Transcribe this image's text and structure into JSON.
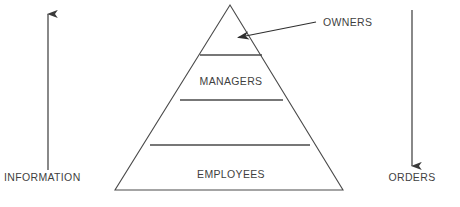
{
  "diagram": {
    "type": "pyramid-hierarchy",
    "background_color": "#ffffff",
    "line_color": "#4a4a4a",
    "text_color": "#3f3f3f",
    "pyramid": {
      "apex": {
        "x": 230,
        "y": 5
      },
      "base_left": {
        "x": 115,
        "y": 190
      },
      "base_right": {
        "x": 343,
        "y": 190
      },
      "levels": [
        {
          "name": "owners",
          "label": "",
          "divider_y": 55,
          "divider_x1": 200,
          "divider_x2": 262
        },
        {
          "name": "managers",
          "label": "MANAGERS",
          "divider_y": 100,
          "divider_x1": 180,
          "divider_x2": 283
        },
        {
          "name": "middle-band",
          "label": "",
          "divider_y": 145,
          "divider_x1": 150,
          "divider_x2": 310
        },
        {
          "name": "employees",
          "label": "EMPLOYEES",
          "divider_y": 190,
          "divider_x1": 115,
          "divider_x2": 343
        }
      ]
    },
    "labels": {
      "owners": "OWNERS",
      "managers": "MANAGERS",
      "employees": "EMPLOYEES",
      "information": "INFORMATION",
      "orders": "ORDERS"
    },
    "callout": {
      "name": "owners-callout",
      "text": "OWNERS",
      "leader_start": {
        "x": 316,
        "y": 22
      },
      "leader_end": {
        "x": 234,
        "y": 38
      },
      "arrow_direction": "left"
    },
    "arrows": [
      {
        "name": "information-arrow",
        "label": "INFORMATION",
        "direction": "up",
        "x": 48,
        "y_start": 170,
        "y_end": 8
      },
      {
        "name": "orders-arrow",
        "label": "ORDERS",
        "direction": "down",
        "x": 412,
        "y_start": 10,
        "y_end": 172
      }
    ],
    "caption_fragment": ""
  }
}
